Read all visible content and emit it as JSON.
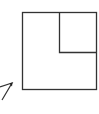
{
  "diagram": {
    "stroke_color": "#333333",
    "background": "#ffffff",
    "shapes": [
      {
        "name": "outer-square",
        "type": "rect",
        "x": 22,
        "y": 12,
        "width": 74,
        "height": 77
      },
      {
        "name": "inner-square",
        "type": "rect",
        "x": 59,
        "y": 12,
        "width": 37,
        "height": 40
      },
      {
        "name": "partial-pointer",
        "type": "polyline",
        "points": "0,87 12,83 2,99"
      }
    ]
  }
}
